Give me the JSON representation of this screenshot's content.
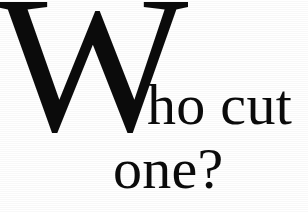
{
  "image": {
    "kind": "scanned-text-snippet",
    "background_color": "#ffffff",
    "ink_color": "#0b0b0b",
    "full_text": "Who cut one?"
  },
  "text": {
    "dropcap": "W",
    "line_one": "ho cut",
    "line_two": "one?"
  }
}
